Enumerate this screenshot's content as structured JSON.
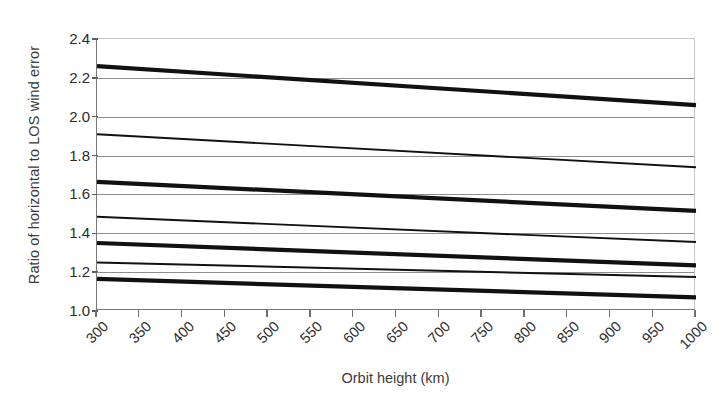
{
  "chart_data": {
    "type": "line",
    "title": "",
    "xlabel": "Orbit height (km)",
    "ylabel": "Ratio of horizontal to LOS wind error",
    "xlim": [
      300,
      1000
    ],
    "ylim": [
      1.0,
      2.4
    ],
    "x_tick_labels": [
      "300",
      "350",
      "400",
      "450",
      "500",
      "550",
      "600",
      "650",
      "700",
      "750",
      "800",
      "850",
      "900",
      "950",
      "1000"
    ],
    "y_tick_labels": [
      "2.4",
      "2.2",
      "2.0",
      "1.8",
      "1.6",
      "1.4",
      "1.2",
      "1.0"
    ],
    "y_ticks": [
      2.4,
      2.2,
      2.0,
      1.8,
      1.6,
      1.4,
      1.2,
      1.0
    ],
    "grid": "horizontal",
    "legend_position": "none",
    "x": [
      300,
      1000
    ],
    "series": [
      {
        "name": "series-1",
        "style": "thick",
        "values": [
          2.26,
          2.06
        ]
      },
      {
        "name": "series-2",
        "style": "thin",
        "values": [
          1.91,
          1.74
        ]
      },
      {
        "name": "series-3",
        "style": "thick",
        "values": [
          1.665,
          1.515
        ]
      },
      {
        "name": "series-4",
        "style": "thin",
        "values": [
          1.485,
          1.355
        ]
      },
      {
        "name": "series-5",
        "style": "thick",
        "values": [
          1.35,
          1.235
        ]
      },
      {
        "name": "series-6",
        "style": "thin",
        "values": [
          1.25,
          1.175
        ]
      },
      {
        "name": "series-7",
        "style": "thick",
        "values": [
          1.165,
          1.07
        ]
      }
    ],
    "line_color": "#111111",
    "grid_color": "#8e8e8e",
    "axis_color": "#7a7a7a",
    "background_color": "#ffffff"
  }
}
